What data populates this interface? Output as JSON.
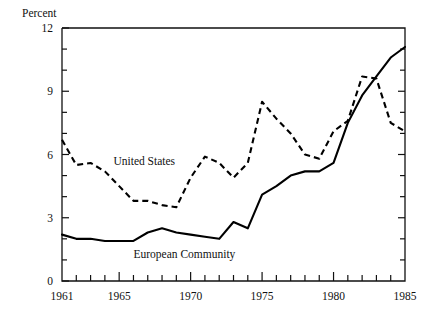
{
  "chart_data": {
    "type": "line",
    "title": "",
    "subtitle": "",
    "xlabel": "",
    "ylabel": "Percent",
    "ylim": [
      0,
      12
    ],
    "xlim": [
      1961,
      1985
    ],
    "grid": false,
    "legend_position": "inline-annotation",
    "y_ticks_major": [
      "0",
      "3",
      "6",
      "9",
      "12"
    ],
    "y_tick_values_major": [
      0,
      3,
      6,
      9,
      12
    ],
    "y_tick_values_minor": [
      1,
      2,
      4,
      5,
      7,
      8,
      10,
      11
    ],
    "x_ticks_major": [
      "1961",
      "1965",
      "1970",
      "1975",
      "1980",
      "1985"
    ],
    "x_tick_values_major": [
      1961,
      1965,
      1970,
      1975,
      1980,
      1985
    ],
    "x_tick_values_minor": [
      1962,
      1963,
      1964,
      1966,
      1967,
      1968,
      1969,
      1971,
      1972,
      1973,
      1974,
      1976,
      1977,
      1978,
      1979,
      1981,
      1982,
      1983,
      1984
    ],
    "x": [
      1961,
      1962,
      1963,
      1964,
      1965,
      1966,
      1967,
      1968,
      1969,
      1970,
      1971,
      1972,
      1973,
      1974,
      1975,
      1976,
      1977,
      1978,
      1979,
      1980,
      1981,
      1982,
      1983,
      1984,
      1985
    ],
    "series": [
      {
        "name": "United States",
        "style": "dashed",
        "color": "#000000",
        "values": [
          6.7,
          5.5,
          5.6,
          5.2,
          4.5,
          3.8,
          3.8,
          3.6,
          3.5,
          4.9,
          5.9,
          5.6,
          4.9,
          5.6,
          8.5,
          7.7,
          7.0,
          6.0,
          5.8,
          7.1,
          7.6,
          9.7,
          9.6,
          7.5,
          7.1
        ]
      },
      {
        "name": "European Community",
        "style": "solid",
        "color": "#000000",
        "values": [
          2.2,
          2.0,
          2.0,
          1.9,
          1.9,
          1.9,
          2.3,
          2.5,
          2.3,
          2.2,
          2.1,
          2.0,
          2.8,
          2.5,
          4.1,
          4.5,
          5.0,
          5.2,
          5.2,
          5.6,
          7.5,
          8.8,
          9.7,
          10.6,
          11.1
        ]
      }
    ],
    "annotations": [
      {
        "text": "United States",
        "x": 1964.6,
        "y": 5.5
      },
      {
        "text": "European Community",
        "x": 1966.0,
        "y": 1.1
      }
    ]
  }
}
